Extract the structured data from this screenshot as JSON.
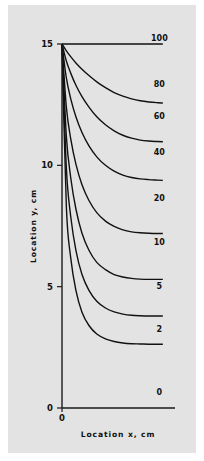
{
  "chart_data": {
    "type": "line",
    "title": "",
    "subtitle": "",
    "xlabel": "Location x, cm",
    "ylabel": "Location y, cm",
    "xlim": [
      0,
      13
    ],
    "ylim": [
      0,
      15
    ],
    "grid": false,
    "legend_position": "inline-right-end-labels",
    "x_ticks": [
      {
        "value": 0,
        "label": "0"
      }
    ],
    "y_ticks": [
      {
        "value": 0,
        "label": "0"
      },
      {
        "value": 5,
        "label": "5"
      },
      {
        "value": 10,
        "label": "10"
      },
      {
        "value": 15,
        "label": "15"
      }
    ],
    "annotations": [
      {
        "text": "100",
        "x": 11.2,
        "y": 15.0
      },
      {
        "text": "80",
        "x": 11.2,
        "y": 13.1
      },
      {
        "text": "60",
        "x": 11.2,
        "y": 11.8
      },
      {
        "text": "40",
        "x": 11.2,
        "y": 10.3
      },
      {
        "text": "20",
        "x": 11.2,
        "y": 8.4
      },
      {
        "text": "10",
        "x": 11.2,
        "y": 6.6
      },
      {
        "text": "5",
        "x": 11.2,
        "y": 4.8
      },
      {
        "text": "2",
        "x": 11.2,
        "y": 3.0
      },
      {
        "text": "0",
        "x": 11.2,
        "y": 0.4
      }
    ],
    "series": [
      {
        "name": "100",
        "label": "100",
        "x": [
          0.0,
          0.8,
          1.7,
          2.6,
          3.5,
          4.4,
          5.3,
          6.2,
          7.1,
          8.0,
          8.9,
          9.8,
          10.7,
          11.6
        ],
        "values": [
          15.0,
          15.0,
          15.0,
          15.0,
          15.0,
          15.0,
          15.0,
          15.0,
          15.0,
          15.0,
          15.0,
          15.0,
          15.0,
          15.0
        ]
      },
      {
        "name": "80",
        "label": "80",
        "x": [
          0.0,
          0.5,
          1.0,
          1.6,
          2.3,
          3.1,
          4.0,
          5.0,
          6.0,
          7.0,
          8.0,
          9.0,
          10.0,
          11.0,
          11.6
        ],
        "values": [
          15.0,
          14.72,
          14.48,
          14.22,
          13.96,
          13.7,
          13.44,
          13.2,
          13.0,
          12.85,
          12.74,
          12.66,
          12.61,
          12.58,
          12.57
        ]
      },
      {
        "name": "60",
        "label": "60",
        "x": [
          0.0,
          0.5,
          1.0,
          1.6,
          2.3,
          3.1,
          4.0,
          5.0,
          6.0,
          7.0,
          8.0,
          9.0,
          10.0,
          11.0,
          11.6
        ],
        "values": [
          15.0,
          14.3,
          13.8,
          13.3,
          12.83,
          12.4,
          12.0,
          11.67,
          11.42,
          11.24,
          11.12,
          11.04,
          11.0,
          10.98,
          10.97
        ]
      },
      {
        "name": "40",
        "label": "40",
        "x": [
          0.0,
          0.5,
          1.0,
          1.6,
          2.3,
          3.1,
          4.0,
          5.0,
          6.0,
          7.0,
          8.0,
          9.0,
          10.0,
          11.0,
          11.6
        ],
        "values": [
          15.0,
          13.6,
          12.75,
          12.0,
          11.35,
          10.8,
          10.35,
          10.0,
          9.76,
          9.6,
          9.5,
          9.44,
          9.41,
          9.39,
          9.38
        ]
      },
      {
        "name": "20",
        "label": "20",
        "x": [
          0.0,
          0.5,
          1.0,
          1.6,
          2.3,
          3.1,
          4.0,
          5.0,
          6.0,
          7.0,
          8.0,
          9.0,
          10.0,
          11.0,
          11.6
        ],
        "values": [
          15.0,
          12.4,
          11.1,
          10.05,
          9.2,
          8.55,
          8.05,
          7.7,
          7.48,
          7.34,
          7.26,
          7.22,
          7.2,
          7.19,
          7.19
        ]
      },
      {
        "name": "10",
        "label": "10",
        "x": [
          0.0,
          0.5,
          1.0,
          1.6,
          2.3,
          3.1,
          4.0,
          5.0,
          6.0,
          7.0,
          8.0,
          9.0,
          10.0,
          11.0,
          11.6
        ],
        "values": [
          15.0,
          11.2,
          9.5,
          8.2,
          7.2,
          6.5,
          6.0,
          5.7,
          5.5,
          5.4,
          5.34,
          5.31,
          5.3,
          5.3,
          5.3
        ]
      },
      {
        "name": "5",
        "label": "5",
        "x": [
          0.0,
          0.5,
          1.0,
          1.6,
          2.3,
          3.1,
          4.0,
          5.0,
          6.0,
          7.0,
          8.0,
          9.0,
          10.0,
          11.0,
          11.6
        ],
        "values": [
          15.0,
          9.9,
          7.9,
          6.5,
          5.5,
          4.85,
          4.4,
          4.12,
          3.96,
          3.87,
          3.82,
          3.8,
          3.79,
          3.79,
          3.79
        ]
      },
      {
        "name": "2",
        "label": "2",
        "x": [
          0.0,
          0.5,
          1.0,
          1.6,
          2.3,
          3.1,
          4.0,
          5.0,
          6.0,
          7.0,
          8.0,
          9.0,
          10.0,
          11.0,
          11.6
        ],
        "values": [
          15.0,
          8.3,
          6.2,
          4.85,
          3.95,
          3.4,
          3.05,
          2.85,
          2.74,
          2.68,
          2.65,
          2.64,
          2.63,
          2.63,
          2.63
        ]
      },
      {
        "name": "0",
        "label": "0",
        "x": [
          0.0,
          2.0,
          4.0,
          6.0,
          8.0,
          10.0,
          11.6
        ],
        "values": [
          0.0,
          0.0,
          0.0,
          0.0,
          0.0,
          0.0,
          0.0
        ]
      }
    ]
  },
  "figure": {
    "background_color": "#ffffff",
    "panel_color": "#e3e3e3",
    "line_color": "#111111"
  }
}
